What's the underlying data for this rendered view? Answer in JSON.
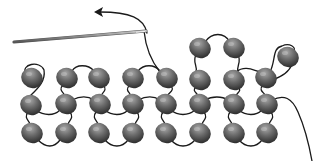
{
  "diagram": {
    "colors": {
      "background": "#ffffff",
      "thread": "#1a1a1a",
      "bead_light": "#9a9a9a",
      "bead_mid": "#6a6a6a",
      "bead_dark": "#2e2e2e",
      "needle": "#8a8a8a"
    },
    "needle": {
      "x1": 14,
      "y1": 42,
      "x2": 146,
      "y2": 31
    },
    "arrow": {
      "direction": "left",
      "tip": [
        95,
        11
      ]
    },
    "beads": [
      {
        "row": "top",
        "x": 200,
        "y": 48
      },
      {
        "row": "top",
        "x": 234,
        "y": 48
      },
      {
        "row": "loose",
        "x": 288,
        "y": 57
      },
      {
        "row": 1,
        "x": 32,
        "y": 78
      },
      {
        "row": 1,
        "x": 67,
        "y": 78
      },
      {
        "row": 1,
        "x": 99,
        "y": 78
      },
      {
        "row": 1,
        "x": 133,
        "y": 78
      },
      {
        "row": 1,
        "x": 167,
        "y": 78
      },
      {
        "row": 1,
        "x": 200,
        "y": 80
      },
      {
        "row": 1,
        "x": 234,
        "y": 80
      },
      {
        "row": 1,
        "x": 266,
        "y": 78
      },
      {
        "row": 2,
        "x": 31,
        "y": 105
      },
      {
        "row": 2,
        "x": 66,
        "y": 104
      },
      {
        "row": 2,
        "x": 100,
        "y": 104
      },
      {
        "row": 2,
        "x": 133,
        "y": 104
      },
      {
        "row": 2,
        "x": 166,
        "y": 104
      },
      {
        "row": 2,
        "x": 200,
        "y": 104
      },
      {
        "row": 2,
        "x": 234,
        "y": 104
      },
      {
        "row": 2,
        "x": 267,
        "y": 104
      },
      {
        "row": 3,
        "x": 32,
        "y": 133
      },
      {
        "row": 3,
        "x": 66,
        "y": 133
      },
      {
        "row": 3,
        "x": 99,
        "y": 133
      },
      {
        "row": 3,
        "x": 133,
        "y": 133
      },
      {
        "row": 3,
        "x": 166,
        "y": 133
      },
      {
        "row": 3,
        "x": 200,
        "y": 133
      },
      {
        "row": 3,
        "x": 234,
        "y": 133
      },
      {
        "row": 3,
        "x": 267,
        "y": 133
      }
    ]
  }
}
